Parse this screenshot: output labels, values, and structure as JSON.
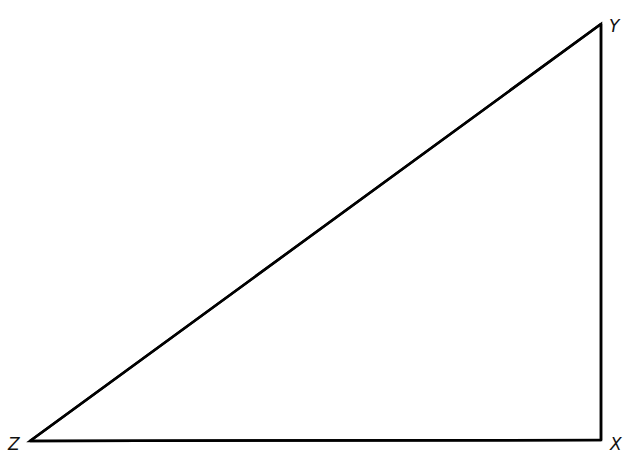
{
  "diagram": {
    "type": "right-triangle",
    "stroke_color": "#000000",
    "background": "#ffffff",
    "vertices": [
      {
        "label": "Y",
        "x": 601,
        "y": 24
      },
      {
        "label": "X",
        "x": 601,
        "y": 440
      },
      {
        "label": "Z",
        "x": 30,
        "y": 441
      }
    ],
    "labels": {
      "Y": "Y",
      "X": "X",
      "Z": "Z"
    },
    "right_angle_at": "X"
  }
}
